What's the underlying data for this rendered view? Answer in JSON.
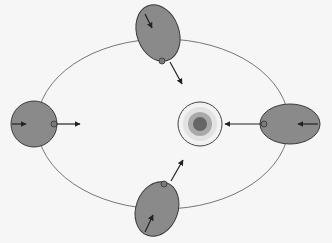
{
  "diagram": {
    "type": "orbital-tidal-diagram",
    "background": "#f6f6f6",
    "colors": {
      "orbit": "#555555",
      "moon_fill": "#8a8a8a",
      "moon_stroke": "#3a3a3a",
      "arrow": "#222222",
      "marker_fill": "#7a7a7a",
      "planet_outer": "#f2f2f2",
      "planet_ring_light": "#e0e0e0",
      "planet_ring_mid": "#a9a9a9",
      "planet_core": "#666666"
    },
    "orbit": {
      "cx": 163,
      "cy": 124,
      "rx": 126,
      "ry": 85
    },
    "central_body": {
      "name": "planet",
      "cx": 200,
      "cy": 124,
      "radii": [
        22,
        18,
        12,
        7
      ]
    },
    "moons": [
      {
        "position": "top",
        "shape": "tilted-ellipse",
        "cx": 157,
        "cy": 32,
        "rx": 21,
        "ry": 29,
        "rotate": -20
      },
      {
        "position": "left",
        "shape": "circle",
        "cx": 34,
        "cy": 124,
        "rx": 23,
        "ry": 23,
        "rotate": 0
      },
      {
        "position": "right",
        "shape": "ellipse",
        "cx": 290,
        "cy": 124,
        "rx": 30,
        "ry": 20,
        "rotate": 0
      },
      {
        "position": "bottom",
        "shape": "tilted-ellipse",
        "cx": 157,
        "cy": 209,
        "rx": 21,
        "ry": 28,
        "rotate": 20
      }
    ]
  }
}
